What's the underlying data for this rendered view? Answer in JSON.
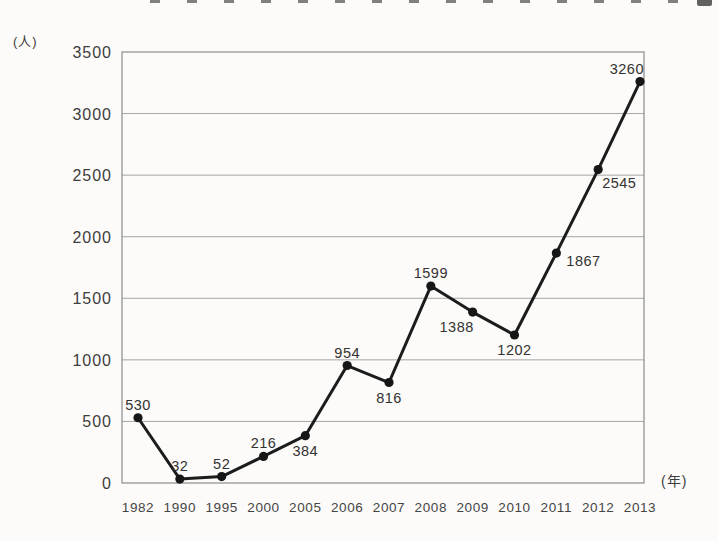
{
  "page": {
    "background": "#fcfbf9",
    "note_title_clipped": "title text cut off at top edge of scan"
  },
  "chart_data": {
    "type": "line",
    "x": [
      "1982",
      "1990",
      "1995",
      "2000",
      "2005",
      "2006",
      "2007",
      "2008",
      "2009",
      "2010",
      "2011",
      "2012",
      "2013"
    ],
    "values": [
      530,
      32,
      52,
      216,
      384,
      954,
      816,
      1599,
      1388,
      1202,
      1867,
      2545,
      3260
    ],
    "label_positions": [
      "above",
      "above",
      "above",
      "above",
      "below",
      "above",
      "below",
      "above",
      "below-left",
      "below",
      "right",
      "right-below",
      "above-end"
    ],
    "y_axis": {
      "unit_label": "(人)",
      "ticks": [
        0,
        500,
        1000,
        1500,
        2000,
        2500,
        3000,
        3500
      ],
      "min": 0,
      "max": 3500
    },
    "x_axis": {
      "unit_label": "(年)"
    },
    "grid": "horizontal",
    "legend": "none",
    "colors": {
      "line": "#1c1c1c",
      "marker": "#161616",
      "grid": "#a6a6a6",
      "border": "#8c8c8c",
      "text": "#3d3d3d"
    }
  }
}
